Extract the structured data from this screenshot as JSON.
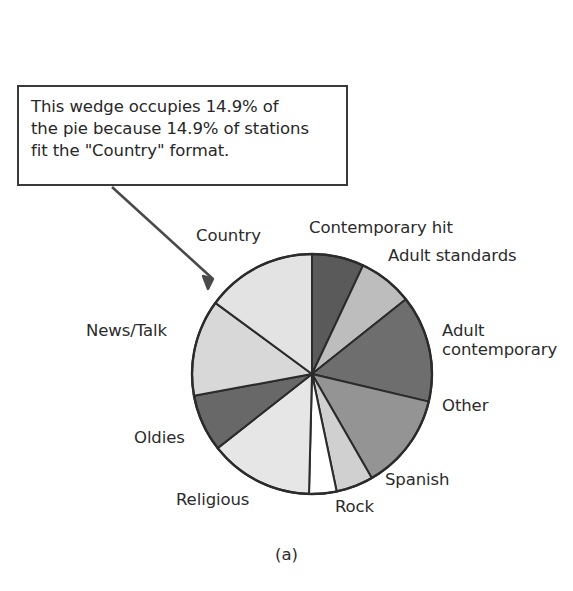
{
  "figure": {
    "caption": "(a)",
    "callout": {
      "text": "This wedge occupies 14.9% of\nthe pie because 14.9% of stations\nfit the \"Country\" format.",
      "border_color": "#3a3a3a",
      "arrow_color": "#4a4a4a",
      "points_to": "Country"
    }
  },
  "chart_data": {
    "type": "pie",
    "title": "",
    "start_angle_deg": 0,
    "direction": "clockwise",
    "center": {
      "x": 312,
      "y": 374
    },
    "radius": 120,
    "outline_color": "#2b2b2b",
    "labels": [
      "Contemporary hit",
      "Adult standards",
      "Adult contemporary",
      "Other",
      "Spanish",
      "Rock",
      "Religious",
      "Oldies",
      "News/Talk",
      "Country"
    ],
    "values": [
      7.0,
      7.3,
      14.4,
      13.0,
      5.0,
      3.7,
      14.0,
      7.7,
      13.0,
      14.9
    ],
    "colors": [
      "#5a5a5a",
      "#bdbdbd",
      "#6e6e6e",
      "#949494",
      "#d0d0d0",
      "#ffffff",
      "#e6e6e6",
      "#686868",
      "#d8d8d8",
      "#e3e3e3"
    ],
    "slices": [
      {
        "label": "Contemporary hit",
        "value": 7.0,
        "color": "#5a5a5a"
      },
      {
        "label": "Adult standards",
        "value": 7.3,
        "color": "#bdbdbd"
      },
      {
        "label": "Adult contemporary",
        "value": 14.4,
        "color": "#6e6e6e"
      },
      {
        "label": "Other",
        "value": 13.0,
        "color": "#949494"
      },
      {
        "label": "Spanish",
        "value": 5.0,
        "color": "#d0d0d0"
      },
      {
        "label": "Rock",
        "value": 3.7,
        "color": "#ffffff"
      },
      {
        "label": "Religious",
        "value": 14.0,
        "color": "#e6e6e6"
      },
      {
        "label": "Oldies",
        "value": 7.7,
        "color": "#686868"
      },
      {
        "label": "News/Talk",
        "value": 13.0,
        "color": "#d8d8d8"
      },
      {
        "label": "Country",
        "value": 14.9,
        "color": "#e3e3e3"
      }
    ],
    "annotations": [
      {
        "text": "This wedge occupies 14.9% of the pie because 14.9% of stations fit the \"Country\" format.",
        "target": "Country"
      }
    ],
    "legend": "none",
    "grid": false
  },
  "label_positions": [
    {
      "name": "contemporary-hit",
      "text": "Contemporary hit",
      "left": 309,
      "top": 218,
      "align": "left"
    },
    {
      "name": "adult-standards",
      "text": "Adult standards",
      "left": 388,
      "top": 246,
      "align": "left"
    },
    {
      "name": "adult-contemporary",
      "text": "Adult\ncontemporary",
      "left": 442,
      "top": 321,
      "align": "left"
    },
    {
      "name": "other",
      "text": "Other",
      "left": 442,
      "top": 396,
      "align": "left"
    },
    {
      "name": "spanish",
      "text": "Spanish",
      "left": 385,
      "top": 470,
      "align": "left"
    },
    {
      "name": "rock",
      "text": "Rock",
      "left": 335,
      "top": 497,
      "align": "left"
    },
    {
      "name": "religious",
      "text": "Religious",
      "left": 176,
      "top": 490,
      "align": "left"
    },
    {
      "name": "oldies",
      "text": "Oldies",
      "left": 134,
      "top": 428,
      "align": "left"
    },
    {
      "name": "news-talk",
      "text": "News/Talk",
      "left": 86,
      "top": 321,
      "align": "left"
    },
    {
      "name": "country",
      "text": "Country",
      "left": 196,
      "top": 226,
      "align": "left"
    }
  ]
}
